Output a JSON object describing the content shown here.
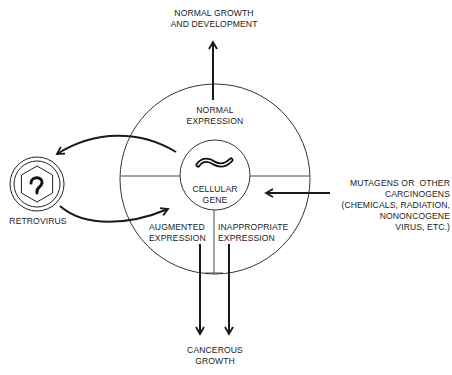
{
  "diagram": {
    "labels": {
      "normal_growth": "NORMAL GROWTH\nAND DEVELOPMENT",
      "normal_expression": "NORMAL\nEXPRESSION",
      "cellular_gene": "CELLULAR\nGENE",
      "augmented_expression": "AUGMENTED\nEXPRESSION",
      "inappropriate_expression": "INAPPROPRIATE\nEXPRESSION",
      "cancerous_growth": "CANCEROUS\nGROWTH",
      "retrovirus": "RETROVIRUS",
      "mutagens": "MUTAGENS OR  OTHER\nCARCINOGENS\n(CHEMICALS, RADIATION,\nNONONCOGENE\nVIRUS, ETC.)"
    },
    "nodes": [
      "cellular-gene",
      "retrovirus",
      "normal-growth",
      "cancerous-growth",
      "mutagens"
    ],
    "edges": [
      {
        "from": "normal-expression",
        "to": "normal-growth"
      },
      {
        "from": "cellular-gene",
        "to": "retrovirus"
      },
      {
        "from": "retrovirus",
        "to": "augmented-expression"
      },
      {
        "from": "mutagens",
        "to": "cellular-gene"
      },
      {
        "from": "augmented-expression",
        "to": "cancerous-growth"
      },
      {
        "from": "inappropriate-expression",
        "to": "cancerous-growth"
      }
    ],
    "colors": {
      "ink": "#1a1a1a",
      "background": "#ffffff"
    }
  }
}
